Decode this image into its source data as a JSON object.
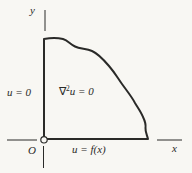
{
  "figure": {
    "axes": {
      "x_label": "x",
      "y_label": "y",
      "origin_label": "O"
    },
    "boundary_conditions": {
      "left": "u = 0",
      "bottom": "u = f(x)"
    },
    "interior_equation": {
      "nabla": "∇",
      "exponent": "2",
      "remainder": "u = 0"
    }
  },
  "colors": {
    "ink": "#2a2a28",
    "paper": "#f8f7f3"
  }
}
